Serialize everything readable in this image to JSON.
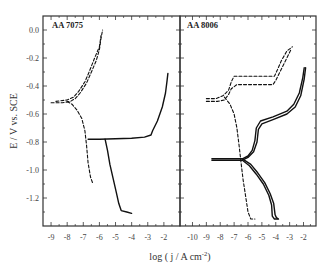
{
  "chart_data": {
    "type": "line",
    "ylabel": "E / V vs. SCE",
    "xlabel": "log (j / A cm-2)",
    "xlabel_parts": {
      "main": "log ( j / A cm",
      "sup": "-2",
      "close": ")"
    },
    "ylim": [
      -1.41,
      0.1
    ],
    "yticks": [
      0.0,
      -0.2,
      -0.4,
      -0.6,
      -0.8,
      -1.0,
      -1.2
    ],
    "ytick_labels": [
      "0.0",
      "-0.2",
      "-0.4",
      "-0.6",
      "-0.8",
      "-1.0",
      "-1.2"
    ],
    "grid": false,
    "legend": null,
    "panels": [
      {
        "title": "AA 7075",
        "xlim": [
          -9.5,
          -1.0
        ],
        "xticks": [
          -9,
          -8,
          -7,
          -6,
          -5,
          -4,
          -3,
          -2
        ],
        "xtick_labels": [
          "-9",
          "-8",
          "-7",
          "-6",
          "-5",
          "-4",
          "-3",
          "-2"
        ],
        "series": [
          {
            "name": "dashed anodic",
            "style": "dashed",
            "points": [
              [
                -9.0,
                -0.52
              ],
              [
                -8.3,
                -0.52
              ],
              [
                -7.8,
                -0.51
              ],
              [
                -7.5,
                -0.49
              ],
              [
                -7.2,
                -0.45
              ],
              [
                -6.8,
                -0.38
              ],
              [
                -6.5,
                -0.3
              ],
              [
                -6.2,
                -0.22
              ],
              [
                -6.0,
                -0.14
              ],
              [
                -5.9,
                -0.06
              ],
              [
                -5.8,
                0.0
              ]
            ]
          },
          {
            "name": "dashed anodic 2",
            "style": "dashed",
            "points": [
              [
                -8.7,
                -0.51
              ],
              [
                -8.0,
                -0.5
              ],
              [
                -7.6,
                -0.48
              ],
              [
                -7.3,
                -0.44
              ],
              [
                -6.9,
                -0.37
              ],
              [
                -6.6,
                -0.29
              ],
              [
                -6.3,
                -0.2
              ],
              [
                -6.0,
                -0.12
              ],
              [
                -5.9,
                -0.04
              ]
            ]
          },
          {
            "name": "dashed cathodic",
            "style": "dashed",
            "points": [
              [
                -8.0,
                -0.51
              ],
              [
                -7.7,
                -0.53
              ],
              [
                -7.4,
                -0.57
              ],
              [
                -7.1,
                -0.63
              ],
              [
                -6.9,
                -0.72
              ],
              [
                -6.8,
                -0.82
              ],
              [
                -6.7,
                -0.95
              ],
              [
                -6.55,
                -1.05
              ],
              [
                -6.4,
                -1.1
              ]
            ]
          },
          {
            "name": "solid anodic",
            "style": "solid",
            "points": [
              [
                -6.7,
                -0.78
              ],
              [
                -6.0,
                -0.78
              ],
              [
                -5.0,
                -0.777
              ],
              [
                -4.0,
                -0.773
              ],
              [
                -3.2,
                -0.765
              ],
              [
                -2.8,
                -0.75
              ],
              [
                -2.7,
                -0.72
              ],
              [
                -2.4,
                -0.65
              ],
              [
                -2.1,
                -0.55
              ],
              [
                -1.9,
                -0.45
              ],
              [
                -1.8,
                -0.36
              ],
              [
                -1.75,
                -0.31
              ]
            ]
          },
          {
            "name": "solid cathodic",
            "style": "solid",
            "points": [
              [
                -5.65,
                -0.78
              ],
              [
                -5.5,
                -0.86
              ],
              [
                -5.35,
                -0.96
              ],
              [
                -5.15,
                -1.06
              ],
              [
                -4.95,
                -1.16
              ],
              [
                -4.8,
                -1.24
              ],
              [
                -4.65,
                -1.29
              ],
              [
                -4.3,
                -1.3
              ],
              [
                -4.0,
                -1.31
              ]
            ]
          }
        ]
      },
      {
        "title": "AA 8006",
        "xlim": [
          -10.9,
          -1.1
        ],
        "xticks": [
          -10,
          -9,
          -8,
          -7,
          -6,
          -5,
          -4,
          -3,
          -2
        ],
        "xtick_labels": [
          "-10",
          "-9",
          "-8",
          "-7",
          "-6",
          "-5",
          "-4",
          "-3",
          "-2"
        ],
        "series": [
          {
            "name": "dashed anodic upper",
            "style": "dashed",
            "points": [
              [
                -9.0,
                -0.49
              ],
              [
                -8.3,
                -0.49
              ],
              [
                -7.8,
                -0.47
              ],
              [
                -7.4,
                -0.43
              ],
              [
                -7.2,
                -0.37
              ],
              [
                -7.0,
                -0.33
              ],
              [
                -5.0,
                -0.33
              ],
              [
                -4.1,
                -0.33
              ],
              [
                -3.9,
                -0.29
              ],
              [
                -3.6,
                -0.22
              ],
              [
                -3.2,
                -0.15
              ],
              [
                -2.8,
                -0.12
              ]
            ]
          },
          {
            "name": "dashed anodic lower",
            "style": "dashed",
            "points": [
              [
                -9.0,
                -0.51
              ],
              [
                -8.2,
                -0.51
              ],
              [
                -7.7,
                -0.5
              ],
              [
                -7.4,
                -0.46
              ],
              [
                -7.2,
                -0.42
              ],
              [
                -6.8,
                -0.39
              ],
              [
                -5.0,
                -0.39
              ],
              [
                -4.2,
                -0.39
              ],
              [
                -4.0,
                -0.36
              ],
              [
                -3.7,
                -0.3
              ],
              [
                -3.3,
                -0.22
              ],
              [
                -2.9,
                -0.14
              ]
            ]
          },
          {
            "name": "dashed cathodic",
            "style": "dashed",
            "points": [
              [
                -7.7,
                -0.48
              ],
              [
                -7.3,
                -0.53
              ],
              [
                -7.0,
                -0.6
              ],
              [
                -6.8,
                -0.7
              ],
              [
                -6.65,
                -0.82
              ],
              [
                -6.5,
                -0.95
              ],
              [
                -6.35,
                -1.07
              ],
              [
                -6.15,
                -1.2
              ],
              [
                -6.0,
                -1.3
              ],
              [
                -5.8,
                -1.35
              ],
              [
                -5.5,
                -1.35
              ]
            ]
          },
          {
            "name": "solid anodic a",
            "style": "solid",
            "points": [
              [
                -8.6,
                -0.93
              ],
              [
                -7.5,
                -0.93
              ],
              [
                -6.4,
                -0.93
              ],
              [
                -6.0,
                -0.91
              ],
              [
                -5.6,
                -0.87
              ],
              [
                -5.35,
                -0.8
              ],
              [
                -5.25,
                -0.71
              ],
              [
                -5.0,
                -0.67
              ],
              [
                -4.2,
                -0.64
              ],
              [
                -3.2,
                -0.6
              ],
              [
                -2.6,
                -0.55
              ],
              [
                -2.2,
                -0.47
              ],
              [
                -1.95,
                -0.35
              ],
              [
                -1.85,
                -0.27
              ]
            ]
          },
          {
            "name": "solid anodic b",
            "style": "solid",
            "points": [
              [
                -8.6,
                -0.92
              ],
              [
                -7.5,
                -0.92
              ],
              [
                -6.4,
                -0.92
              ],
              [
                -6.0,
                -0.9
              ],
              [
                -5.7,
                -0.86
              ],
              [
                -5.5,
                -0.79
              ],
              [
                -5.4,
                -0.7
              ],
              [
                -5.1,
                -0.65
              ],
              [
                -4.2,
                -0.62
              ],
              [
                -3.2,
                -0.58
              ],
              [
                -2.7,
                -0.53
              ],
              [
                -2.3,
                -0.45
              ],
              [
                -2.05,
                -0.34
              ],
              [
                -1.95,
                -0.27
              ]
            ]
          },
          {
            "name": "solid cathodic a",
            "style": "solid",
            "points": [
              [
                -6.4,
                -0.93
              ],
              [
                -5.9,
                -0.97
              ],
              [
                -5.4,
                -1.03
              ],
              [
                -4.9,
                -1.1
              ],
              [
                -4.5,
                -1.18
              ],
              [
                -4.3,
                -1.25
              ],
              [
                -4.25,
                -1.33
              ],
              [
                -4.1,
                -1.35
              ],
              [
                -3.85,
                -1.35
              ]
            ]
          },
          {
            "name": "solid cathodic b",
            "style": "solid",
            "points": [
              [
                -6.4,
                -0.92
              ],
              [
                -5.8,
                -0.96
              ],
              [
                -5.3,
                -1.02
              ],
              [
                -4.8,
                -1.09
              ],
              [
                -4.4,
                -1.17
              ],
              [
                -4.15,
                -1.24
              ],
              [
                -4.05,
                -1.32
              ],
              [
                -3.95,
                -1.34
              ],
              [
                -3.8,
                -1.35
              ]
            ]
          }
        ]
      }
    ]
  }
}
